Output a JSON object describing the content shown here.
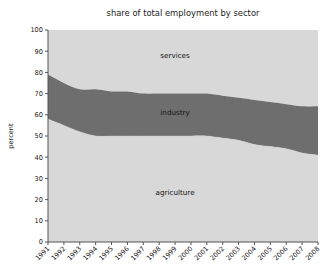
{
  "chart_data": {
    "type": "area",
    "title": "share of total employment by sector",
    "xlabel": "",
    "ylabel": "percent",
    "ylim": [
      0,
      100
    ],
    "ytick_step": 10,
    "yticks": [
      0,
      10,
      20,
      30,
      40,
      50,
      60,
      70,
      80,
      90,
      100
    ],
    "grid": false,
    "legend_position": "inline-labels",
    "stacked": true,
    "x": [
      1991,
      1992,
      1993,
      1994,
      1995,
      1996,
      1997,
      1998,
      1999,
      2000,
      2001,
      2002,
      2003,
      2004,
      2005,
      2006,
      2007,
      2008
    ],
    "categories": [
      "1991",
      "1992",
      "1993",
      "1994",
      "1995",
      "1996",
      "1997",
      "1998",
      "1999",
      "2000",
      "2001",
      "2002",
      "2003",
      "2004",
      "2005",
      "2006",
      "2007",
      "2008"
    ],
    "series": [
      {
        "name": "agriculture",
        "color": "#d8d8d8",
        "values": [
          58,
          55,
          52,
          50,
          50,
          50,
          50,
          50,
          50,
          50,
          50,
          49,
          48,
          46,
          45,
          44,
          42,
          41
        ]
      },
      {
        "name": "industry",
        "color": "#6e6e6e",
        "values": [
          21,
          20,
          20,
          22,
          21,
          21,
          20,
          20,
          20,
          20,
          20,
          20,
          20,
          21,
          21,
          21,
          22,
          23
        ]
      },
      {
        "name": "services",
        "color": "#d8d8d8",
        "values": [
          21,
          25,
          28,
          28,
          29,
          29,
          30,
          30,
          30,
          30,
          30,
          31,
          32,
          33,
          34,
          35,
          36,
          36
        ]
      }
    ],
    "cumulative_boundaries": {
      "agriculture_top": [
        58,
        55,
        52,
        50,
        50,
        50,
        50,
        50,
        50,
        50,
        50,
        49,
        48,
        46,
        45,
        44,
        42,
        41
      ],
      "industry_top": [
        79,
        75,
        72,
        72,
        71,
        71,
        70,
        70,
        70,
        70,
        70,
        69,
        68,
        67,
        66,
        65,
        64,
        64
      ],
      "services_top": [
        100,
        100,
        100,
        100,
        100,
        100,
        100,
        100,
        100,
        100,
        100,
        100,
        100,
        100,
        100,
        100,
        100,
        100
      ]
    },
    "area_labels": [
      {
        "text": "services",
        "x_year": 1999,
        "y_percent": 87
      },
      {
        "text": "industry",
        "x_year": 1999,
        "y_percent": 60
      },
      {
        "text": "agriculture",
        "x_year": 1999,
        "y_percent": 22
      }
    ]
  },
  "colors": {
    "background": "#ffffff",
    "light_band": "#d8d8d8",
    "dark_band": "#6e6e6e",
    "axis": "#555555",
    "text": "#1a1a1a"
  }
}
